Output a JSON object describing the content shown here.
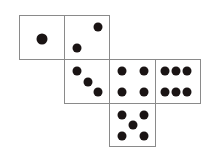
{
  "diagram": {
    "type": "cube-net",
    "title": "",
    "faces": [
      {
        "value": 1,
        "x": 19,
        "y": 15,
        "w": 46,
        "h": 45,
        "pips": [
          [
            22,
            23,
            true
          ]
        ]
      },
      {
        "value": 2,
        "x": 64,
        "y": 15,
        "w": 46,
        "h": 45,
        "pips": [
          [
            33,
            11
          ],
          [
            12,
            32
          ]
        ]
      },
      {
        "value": 3,
        "x": 64,
        "y": 59,
        "w": 46,
        "h": 45,
        "pips": [
          [
            12,
            11
          ],
          [
            23,
            22
          ],
          [
            33,
            32
          ]
        ]
      },
      {
        "value": 4,
        "x": 109,
        "y": 59,
        "w": 47,
        "h": 45,
        "pips": [
          [
            12,
            11
          ],
          [
            34,
            11
          ],
          [
            12,
            32
          ],
          [
            34,
            32
          ]
        ]
      },
      {
        "value": 6,
        "x": 155,
        "y": 59,
        "w": 46,
        "h": 45,
        "pips": [
          [
            9,
            11
          ],
          [
            20,
            11
          ],
          [
            31,
            11
          ],
          [
            9,
            32
          ],
          [
            20,
            32
          ],
          [
            31,
            32
          ]
        ]
      },
      {
        "value": 5,
        "x": 109,
        "y": 103,
        "w": 47,
        "h": 44,
        "pips": [
          [
            12,
            11
          ],
          [
            34,
            11
          ],
          [
            23,
            21
          ],
          [
            12,
            32
          ],
          [
            34,
            32
          ]
        ]
      }
    ],
    "colors": {
      "pip": "#1a1414",
      "border": "#8a8a8a",
      "background": "#ffffff"
    }
  }
}
